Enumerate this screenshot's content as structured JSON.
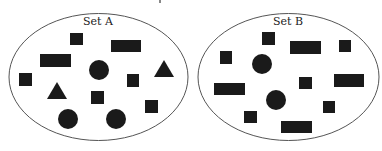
{
  "diagram": {
    "type": "set-comparison",
    "colors": {
      "outline": "#555555",
      "shape_fill": "#1a1a1a",
      "label": "#222222"
    },
    "sets": [
      {
        "name": "Set A",
        "counts": {
          "square": 5,
          "rectangle": 2,
          "circle": 3,
          "triangle": 2,
          "total": 12
        },
        "shapes": [
          "square",
          "rectangle",
          "rectangle",
          "circle",
          "triangle",
          "square",
          "square",
          "triangle",
          "square",
          "square",
          "circle",
          "circle"
        ]
      },
      {
        "name": "Set B",
        "counts": {
          "square": 6,
          "rectangle": 4,
          "circle": 2,
          "triangle": 0,
          "total": 12
        },
        "shapes": [
          "square",
          "rectangle",
          "square",
          "square",
          "circle",
          "square",
          "rectangle",
          "rectangle",
          "circle",
          "square",
          "square",
          "rectangle"
        ]
      }
    ]
  }
}
